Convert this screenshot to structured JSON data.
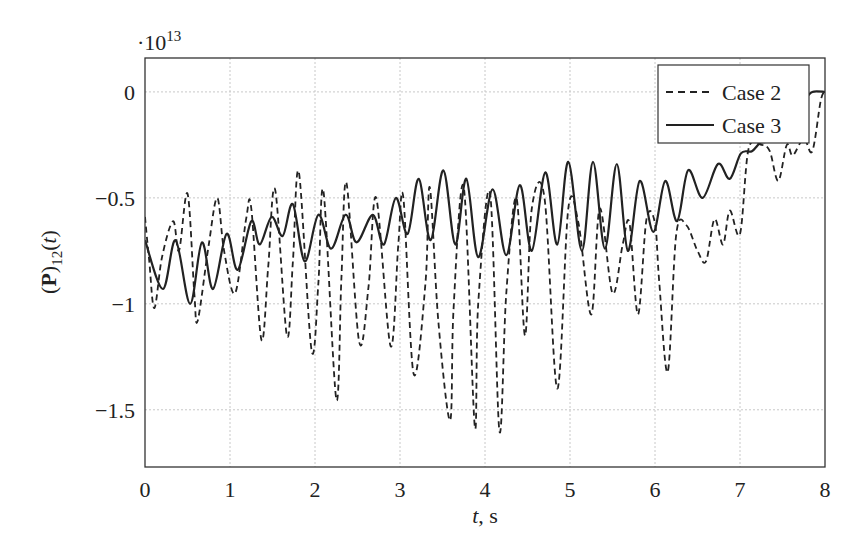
{
  "chart_data": {
    "type": "line",
    "title": "",
    "xlabel": "t, s",
    "xlabel_parts": {
      "var": "t",
      "rest": ", s"
    },
    "ylabel": "(P)12(t)",
    "ylabel_parts": {
      "open": "(",
      "bold": "P",
      "close": ")",
      "sub": "12",
      "arg": "(t)"
    },
    "y_multiplier": "·10",
    "y_multiplier_exp": "13",
    "xlim": [
      0,
      8
    ],
    "ylim": [
      -1.77,
      0.16
    ],
    "xticks": [
      0,
      1,
      2,
      3,
      4,
      5,
      6,
      7,
      8
    ],
    "xtick_labels": [
      "0",
      "1",
      "2",
      "3",
      "4",
      "5",
      "6",
      "7",
      "8"
    ],
    "yticks": [
      0,
      -0.5,
      -1,
      -1.5
    ],
    "ytick_labels": [
      "0",
      "−0.5",
      "−1",
      "−1.5"
    ],
    "grid": true,
    "legend_position": "upper right",
    "series": [
      {
        "name": "Case 2",
        "style": "dashed",
        "color": "#222222",
        "x": [
          0,
          0.05,
          0.11,
          0.2,
          0.33,
          0.4,
          0.5,
          0.58,
          0.62,
          0.75,
          0.85,
          0.93,
          1.06,
          1.19,
          1.25,
          1.37,
          1.45,
          1.53,
          1.67,
          1.74,
          1.81,
          1.96,
          2.04,
          2.1,
          2.25,
          2.31,
          2.37,
          2.52,
          2.63,
          2.72,
          2.89,
          2.98,
          3.04,
          3.16,
          3.3,
          3.35,
          3.45,
          3.59,
          3.63,
          3.75,
          3.88,
          3.92,
          4.06,
          4.17,
          4.25,
          4.37,
          4.47,
          4.55,
          4.7,
          4.85,
          4.98,
          5.1,
          5.25,
          5.35,
          5.5,
          5.62,
          5.7,
          5.8,
          5.9,
          6.0,
          6.05,
          6.15,
          6.25,
          6.37,
          6.5,
          6.6,
          6.7,
          6.8,
          6.88,
          7.0,
          7.1,
          7.25,
          7.35,
          7.45,
          7.55,
          7.62,
          7.75,
          7.85,
          7.95,
          8.0
        ],
        "y": [
          -0.59,
          -0.8,
          -1.02,
          -0.78,
          -0.61,
          -0.75,
          -0.48,
          -0.95,
          -1.08,
          -0.72,
          -0.5,
          -0.75,
          -0.95,
          -0.6,
          -0.55,
          -1.17,
          -0.82,
          -0.46,
          -1.15,
          -0.8,
          -0.38,
          -1.22,
          -0.9,
          -0.47,
          -1.45,
          -0.88,
          -0.43,
          -1.18,
          -0.92,
          -0.5,
          -1.2,
          -0.72,
          -0.5,
          -1.33,
          -0.9,
          -0.45,
          -1.08,
          -1.55,
          -1.02,
          -0.45,
          -1.58,
          -1.0,
          -0.48,
          -1.6,
          -0.95,
          -0.5,
          -1.15,
          -0.55,
          -0.5,
          -1.4,
          -0.55,
          -0.62,
          -1.05,
          -0.55,
          -0.95,
          -0.72,
          -0.62,
          -1.05,
          -0.6,
          -0.62,
          -0.9,
          -1.32,
          -0.67,
          -0.63,
          -0.75,
          -0.8,
          -0.6,
          -0.72,
          -0.56,
          -0.67,
          -0.27,
          -0.25,
          -0.28,
          -0.42,
          -0.25,
          -0.3,
          -0.22,
          -0.28,
          -0.04,
          0.0
        ]
      },
      {
        "name": "Case 3",
        "style": "solid",
        "color": "#222222",
        "x": [
          0,
          0.21,
          0.36,
          0.53,
          0.67,
          0.8,
          0.96,
          1.09,
          1.25,
          1.35,
          1.49,
          1.62,
          1.74,
          1.88,
          2.04,
          2.19,
          2.36,
          2.49,
          2.68,
          2.81,
          2.95,
          3.09,
          3.22,
          3.36,
          3.51,
          3.65,
          3.78,
          3.92,
          4.09,
          4.25,
          4.41,
          4.55,
          4.71,
          4.85,
          4.98,
          5.14,
          5.27,
          5.41,
          5.55,
          5.68,
          5.82,
          5.98,
          6.12,
          6.26,
          6.39,
          6.56,
          6.74,
          6.88,
          7.01,
          7.14,
          7.24,
          7.35,
          7.59,
          7.76,
          7.85,
          8.0
        ],
        "y": [
          -0.7,
          -0.93,
          -0.7,
          -1.0,
          -0.71,
          -0.93,
          -0.67,
          -0.84,
          -0.61,
          -0.72,
          -0.59,
          -0.68,
          -0.53,
          -0.8,
          -0.58,
          -0.74,
          -0.58,
          -0.71,
          -0.58,
          -0.72,
          -0.5,
          -0.67,
          -0.41,
          -0.7,
          -0.37,
          -0.72,
          -0.41,
          -0.78,
          -0.46,
          -0.77,
          -0.44,
          -0.75,
          -0.38,
          -0.72,
          -0.33,
          -0.75,
          -0.33,
          -0.74,
          -0.34,
          -0.75,
          -0.42,
          -0.66,
          -0.42,
          -0.61,
          -0.37,
          -0.5,
          -0.34,
          -0.41,
          -0.29,
          -0.28,
          -0.24,
          -0.23,
          -0.16,
          -0.04,
          0.0,
          0.0
        ]
      }
    ]
  }
}
